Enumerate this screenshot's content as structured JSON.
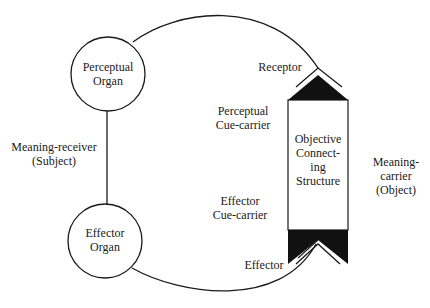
{
  "diagram": {
    "type": "functional-cycle",
    "colors": {
      "stroke": "#1a1a1a",
      "fill_dark": "#111111",
      "background": "#ffffff"
    },
    "nodes": {
      "perceptual_organ": {
        "line1": "Perceptual",
        "line2": "Organ"
      },
      "effector_organ": {
        "line1": "Effector",
        "line2": "Organ"
      },
      "objective_structure": {
        "line1": "Objective",
        "line2": "Connect-",
        "line3": "ing",
        "line4": "Structure"
      }
    },
    "labels": {
      "meaning_receiver": {
        "line1": "Meaning-receiver",
        "line2": "(Subject)"
      },
      "meaning_carrier": {
        "line1": "Meaning-",
        "line2": "carrier",
        "line3": "(Object)"
      },
      "receptor": "Receptor",
      "effector": "Effector",
      "perceptual_cue_carrier": {
        "line1": "Perceptual",
        "line2": "Cue-carrier"
      },
      "effector_cue_carrier": {
        "line1": "Effector",
        "line2": "Cue-carrier"
      }
    }
  }
}
